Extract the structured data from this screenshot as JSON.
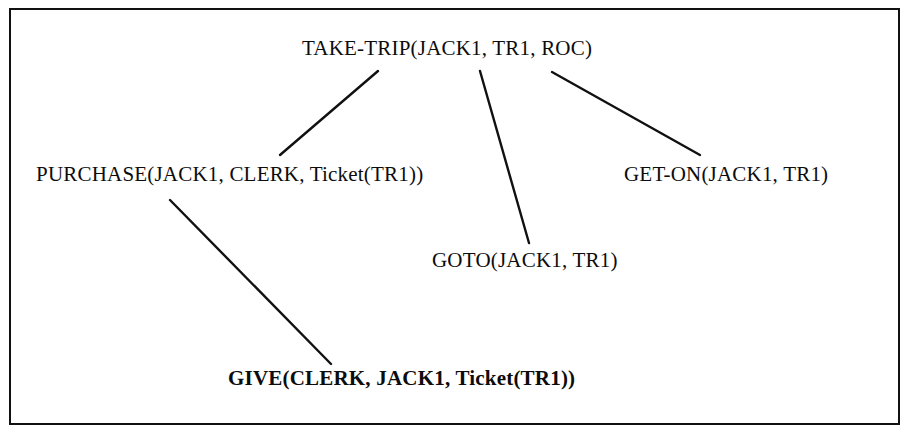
{
  "figure": {
    "type": "plan-decomposition-tree",
    "border_color": "#111111",
    "background_color": "#ffffff",
    "text_color": "#0c0c0c"
  },
  "nodes": [
    {
      "id": "take-trip",
      "label": "TAKE-TRIP(JACK1, TR1, ROC)",
      "bold": false,
      "level": 0
    },
    {
      "id": "purchase",
      "label": "PURCHASE(JACK1, CLERK, Ticket(TR1))",
      "bold": false,
      "level": 1
    },
    {
      "id": "goto",
      "label": "GOTO(JACK1, TR1)",
      "bold": false,
      "level": 1
    },
    {
      "id": "get-on",
      "label": "GET-ON(JACK1, TR1)",
      "bold": false,
      "level": 1
    },
    {
      "id": "give",
      "label": "GIVE(CLERK, JACK1, Ticket(TR1))",
      "bold": true,
      "level": 2
    }
  ],
  "edges": [
    {
      "id": "take-trip-to-purchase",
      "from": "take-trip",
      "to": "purchase",
      "x1": 378,
      "y1": 71,
      "x2": 280,
      "y2": 155
    },
    {
      "id": "take-trip-to-goto",
      "from": "take-trip",
      "to": "goto",
      "x1": 480,
      "y1": 71,
      "x2": 529,
      "y2": 243
    },
    {
      "id": "take-trip-to-get-on",
      "from": "take-trip",
      "to": "get-on",
      "x1": 552,
      "y1": 72,
      "x2": 700,
      "y2": 155
    },
    {
      "id": "purchase-to-give",
      "from": "purchase",
      "to": "give",
      "x1": 170,
      "y1": 200,
      "x2": 331,
      "y2": 364
    }
  ]
}
